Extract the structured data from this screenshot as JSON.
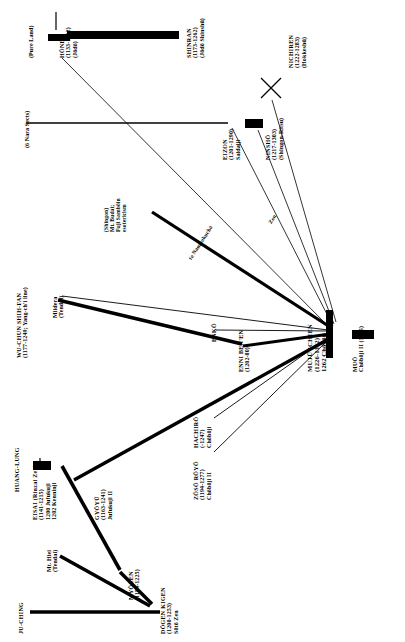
{
  "diagram": {
    "orientation": "labels rotated 90 degrees counter-clockwise",
    "groups": [
      {
        "id": "pure-land",
        "label": "(Pure Land)"
      },
      {
        "id": "nara-sects",
        "label": "(6 Nara Sects)"
      },
      {
        "id": "huang-lung",
        "label": "HUANG-LUNG"
      },
      {
        "id": "ju-ching",
        "label": "JU-CHING"
      }
    ],
    "nodes": [
      {
        "id": "honen",
        "name": "HŌNEN",
        "dates": "(1133-1212)",
        "school": "(Jōdō)"
      },
      {
        "id": "shinran",
        "name": "SHINRAN",
        "dates": "(1173-1262)",
        "school": "(Jōdō Shinshū)"
      },
      {
        "id": "nichiren",
        "name": "NICHIREN",
        "dates": "(1222-1283)",
        "school": "(Hokkeshū)"
      },
      {
        "id": "eizon",
        "name": "EIZON",
        "dates": "(1201-1290)",
        "school": "Saidaiji"
      },
      {
        "id": "ninsho",
        "name": "NINSHŌ",
        "dates": "(1217-1303)",
        "school": "(Shingon-Ritsu)"
      },
      {
        "id": "shingon-esotericism",
        "name": "(Shingon)",
        "dates": "Mt. Budai;",
        "school": "Fuji Sambōin",
        "extra": "esotericism"
      },
      {
        "id": "wu-chun",
        "name": "WU-CHUN SHIH-FAN",
        "dates": "(1177-1249; Yang-ch'i line)",
        "school": ""
      },
      {
        "id": "miidera",
        "name": "Miidera",
        "dates": "(Tendai)",
        "school": ""
      },
      {
        "id": "enko",
        "name": "ENKŌ",
        "dates": "",
        "school": ""
      },
      {
        "id": "enni-benen",
        "name": "ENNI BEN'EN",
        "dates": "(1202-80)",
        "school": ""
      },
      {
        "id": "muju-ichien",
        "name": "MUJŪ ICHIEN",
        "dates": "(1226-1312)",
        "school": "1262 Chōbōji"
      },
      {
        "id": "muo",
        "name": "MUŌ",
        "dates": "Chōbōji II (1305)",
        "school": ""
      },
      {
        "id": "eisai",
        "name": "EISAI (Rinzai Zen)",
        "dates": "(1141-1215)",
        "school": "1200 Jufukuji",
        "extra": "1202 Kenninji"
      },
      {
        "id": "gyoyu",
        "name": "GYŌYŪ",
        "dates": "(1163-1241)",
        "school": "Jufukuji II"
      },
      {
        "id": "myozen",
        "name": "MYŌZEN",
        "dates": "(1184-1225)",
        "school": ""
      },
      {
        "id": "dogen",
        "name": "DŌGEN KIGEN",
        "dates": "(1200-1253)",
        "school": "Sōtō Zen"
      },
      {
        "id": "hachiro",
        "name": "HACHIRŌ",
        "dates": "(-1247)",
        "school": "Chōbōji"
      },
      {
        "id": "zoso-royo",
        "name": "ZŌSŌ RŌYŌ",
        "dates": "(1194-1277)",
        "school": "Chōbōji II"
      },
      {
        "id": "mt-hiei",
        "name": "Mt. Hiei",
        "dates": "(Tendai)",
        "school": ""
      }
    ],
    "edges": [
      {
        "from": "honen",
        "to": "shinran",
        "weight": "thick"
      },
      {
        "from": "eizon",
        "to": "ninsho",
        "weight": "thick"
      },
      {
        "from": "nara-sects",
        "to": "eizon",
        "weight": "thin"
      },
      {
        "from": "honen",
        "to": "muju-ichien",
        "weight": "thin"
      },
      {
        "from": "nichiren",
        "to": "muju-ichien",
        "weight": "thin"
      },
      {
        "from": "ninsho",
        "to": "muju-ichien",
        "weight": "thin"
      },
      {
        "from": "shingon-esotericism",
        "to": "muju-ichien",
        "weight": "thick"
      },
      {
        "from": "miidera",
        "to": "muju-ichien",
        "weight": "thin"
      },
      {
        "from": "wu-chun",
        "to": "enni-benen",
        "weight": "thick"
      },
      {
        "from": "enni-benen",
        "to": "muju-ichien",
        "weight": "thick"
      },
      {
        "from": "enko",
        "to": "muju-ichien",
        "weight": "thin"
      },
      {
        "from": "muju-ichien",
        "to": "muo",
        "weight": "thick"
      },
      {
        "from": "hachiro",
        "to": "muju-ichien",
        "weight": "thin"
      },
      {
        "from": "zoso-royo",
        "to": "muju-ichien",
        "weight": "thin"
      },
      {
        "from": "huang-lung",
        "to": "eisai",
        "weight": "thick"
      },
      {
        "from": "eisai",
        "to": "gyoyu",
        "weight": "thick"
      },
      {
        "from": "eisai",
        "to": "myozen",
        "weight": "thick"
      },
      {
        "from": "myozen",
        "to": "dogen",
        "weight": "thick"
      },
      {
        "from": "ju-ching",
        "to": "dogen",
        "weight": "thick"
      },
      {
        "from": "mt-hiei",
        "to": "dogen",
        "weight": "thick"
      },
      {
        "from": "gyoyu",
        "to": "muju-ichien",
        "weight": "thick"
      }
    ],
    "annotations": [
      {
        "id": "shingon-route",
        "text": "to Nambokuchō"
      },
      {
        "id": "zen-route",
        "text": "Zen"
      }
    ],
    "marks": [
      {
        "id": "nichiren-cross",
        "glyph": "×"
      }
    ]
  }
}
